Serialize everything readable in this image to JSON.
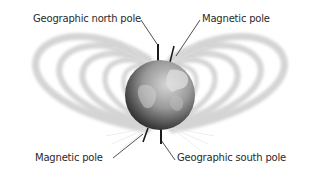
{
  "diagram": {
    "labels": {
      "geographic_north_pole": "Geographic north pole",
      "magnetic_pole_top": "Magnetic pole",
      "magnetic_pole_bottom": "Magnetic pole",
      "geographic_south_pole": "Geographic south pole"
    },
    "colors": {
      "background": "#ffffff",
      "field_lines": "#d8d8d8",
      "globe_dark": "#2e2e2e",
      "globe_light": "#c8c8c8",
      "axis_line": "#1a1a1a",
      "text": "#2a2a2a"
    }
  }
}
